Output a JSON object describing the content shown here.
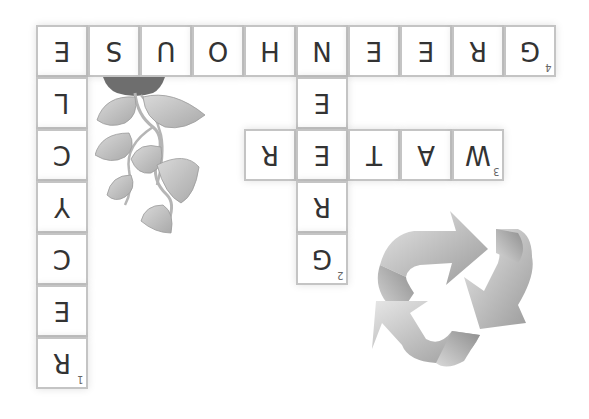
{
  "puzzle": {
    "type": "crossword",
    "orientation": "rotated-180",
    "cell_size_px": 52,
    "origin_px": [
      36,
      25
    ],
    "colors": {
      "cell_border": "#c4c4c4",
      "letter": "#333333",
      "number": "#666666",
      "background": "#ffffff"
    },
    "words": [
      {
        "number": "1",
        "direction": "down",
        "answer": "RECYCLE"
      },
      {
        "number": "2",
        "direction": "down",
        "answer": "GREEN"
      },
      {
        "number": "3",
        "direction": "across",
        "answer": "WATER"
      },
      {
        "number": "4",
        "direction": "across",
        "answer": "GREENHOUSE"
      }
    ],
    "cells": [
      {
        "row": 0,
        "col": 0,
        "letter": "E",
        "number": ""
      },
      {
        "row": 0,
        "col": 1,
        "letter": "S",
        "number": ""
      },
      {
        "row": 0,
        "col": 2,
        "letter": "U",
        "number": ""
      },
      {
        "row": 0,
        "col": 3,
        "letter": "O",
        "number": ""
      },
      {
        "row": 0,
        "col": 4,
        "letter": "H",
        "number": ""
      },
      {
        "row": 0,
        "col": 5,
        "letter": "N",
        "number": ""
      },
      {
        "row": 0,
        "col": 6,
        "letter": "E",
        "number": ""
      },
      {
        "row": 0,
        "col": 7,
        "letter": "E",
        "number": ""
      },
      {
        "row": 0,
        "col": 8,
        "letter": "R",
        "number": ""
      },
      {
        "row": 0,
        "col": 9,
        "letter": "G",
        "number": "4"
      },
      {
        "row": 1,
        "col": 0,
        "letter": "L",
        "number": ""
      },
      {
        "row": 1,
        "col": 5,
        "letter": "E",
        "number": ""
      },
      {
        "row": 2,
        "col": 0,
        "letter": "C",
        "number": ""
      },
      {
        "row": 2,
        "col": 4,
        "letter": "R",
        "number": ""
      },
      {
        "row": 2,
        "col": 5,
        "letter": "E",
        "number": ""
      },
      {
        "row": 2,
        "col": 6,
        "letter": "T",
        "number": ""
      },
      {
        "row": 2,
        "col": 7,
        "letter": "A",
        "number": ""
      },
      {
        "row": 2,
        "col": 8,
        "letter": "W",
        "number": "3"
      },
      {
        "row": 3,
        "col": 0,
        "letter": "Y",
        "number": ""
      },
      {
        "row": 3,
        "col": 5,
        "letter": "R",
        "number": ""
      },
      {
        "row": 4,
        "col": 0,
        "letter": "C",
        "number": ""
      },
      {
        "row": 4,
        "col": 5,
        "letter": "G",
        "number": "2"
      },
      {
        "row": 5,
        "col": 0,
        "letter": "E",
        "number": ""
      },
      {
        "row": 6,
        "col": 0,
        "letter": "R",
        "number": "1"
      }
    ]
  },
  "decorations": {
    "plant": "plant-vine-illustration",
    "recycle": "recycle-symbol-icon"
  }
}
